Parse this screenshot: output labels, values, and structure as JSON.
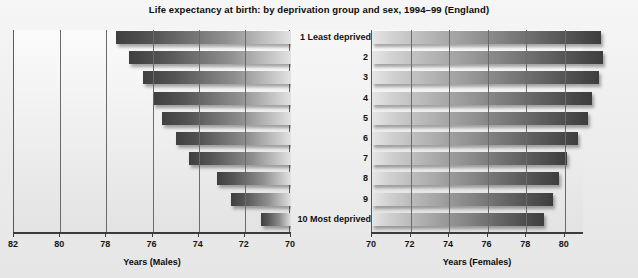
{
  "chart_data": {
    "type": "bar",
    "title": "Life expectancy at birth: by deprivation group and sex, 1994–99 (England)",
    "orientation": "horizontal",
    "layout": "back-to-back butterfly / tornado; males on left panel (axis reversed), females on right panel",
    "grid": true,
    "legend_position": "none",
    "categories": [
      "1 Least deprived",
      "2",
      "3",
      "4",
      "5",
      "6",
      "7",
      "8",
      "9",
      "10 Most deprived"
    ],
    "series": [
      {
        "name": "Years (Males)",
        "panel": "left",
        "axis_reversed": true,
        "xlabel": "Years (Males)",
        "xlim": [
          82,
          70
        ],
        "xticks": [
          82,
          80,
          78,
          76,
          74,
          72,
          70
        ],
        "values": [
          77.6,
          77.0,
          76.4,
          76.0,
          75.6,
          75.0,
          74.4,
          73.2,
          72.6,
          71.3
        ]
      },
      {
        "name": "Years (Females)",
        "panel": "right",
        "axis_reversed": false,
        "xlabel": "Years (Females)",
        "xlim": [
          70,
          81
        ],
        "xticks": [
          70,
          72,
          74,
          76,
          78,
          80
        ],
        "values": [
          81.9,
          82.0,
          81.8,
          81.4,
          81.2,
          80.7,
          80.1,
          79.7,
          79.4,
          78.9
        ]
      }
    ],
    "xlabel_left": "Years (Males)",
    "xlabel_right": "Years (Females)",
    "ylabel": "Deprivation group"
  },
  "colors": {
    "bar_dark": "#3f3f3f",
    "bar_light": "#e2e2e2",
    "axis": "#3b3b3b",
    "grid": "#6b6b6b",
    "text": "#111111",
    "page_background": "#eeeeee"
  }
}
